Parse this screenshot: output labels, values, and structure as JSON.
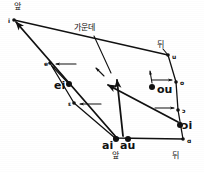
{
  "figure": {
    "type": "vowel-diagram",
    "width": 204,
    "height": 172,
    "ink_color": "#111111",
    "background_color": "#ffffff"
  },
  "axis_labels": [
    {
      "id": "front-top",
      "text": "앞",
      "x": 14,
      "y": 3,
      "meaning": "front"
    },
    {
      "id": "middle-top",
      "text": "가운데",
      "x": 74,
      "y": 24,
      "meaning": "middle"
    },
    {
      "id": "back-top",
      "text": "뒤",
      "x": 157,
      "y": 41,
      "meaning": "back"
    },
    {
      "id": "front-bottom",
      "text": "앞",
      "x": 112,
      "y": 152,
      "meaning": "front"
    },
    {
      "id": "back-bottom",
      "text": "뒤",
      "x": 172,
      "y": 152,
      "meaning": "back"
    }
  ],
  "vowel_points": [
    {
      "symbol": "i",
      "x": 14,
      "y": 20,
      "label_dx": -6,
      "label_dy": 1,
      "size": "small"
    },
    {
      "symbol": "e",
      "x": 50,
      "y": 63,
      "label_dx": -6,
      "label_dy": 1,
      "size": "small"
    },
    {
      "symbol": "ɛ",
      "x": 74,
      "y": 103,
      "label_dx": -6,
      "label_dy": 1,
      "size": "small"
    },
    {
      "symbol": "a",
      "x": 115,
      "y": 138,
      "label_dx": 0,
      "label_dy": 0,
      "size": "small"
    },
    {
      "symbol": "ɑ",
      "x": 183,
      "y": 139,
      "label_dx": 4,
      "label_dy": 2,
      "size": "small"
    },
    {
      "symbol": "ɔ",
      "x": 178,
      "y": 110,
      "label_dx": 4,
      "label_dy": 1,
      "size": "small"
    },
    {
      "symbol": "o",
      "x": 176,
      "y": 82,
      "label_dx": 4,
      "label_dy": 1,
      "size": "small"
    },
    {
      "symbol": "u",
      "x": 168,
      "y": 55,
      "label_dx": 4,
      "label_dy": 2,
      "size": "small"
    }
  ],
  "diphthongs": [
    {
      "symbol": "ei",
      "x": 69,
      "y": 84,
      "label_x": 54,
      "label_y": 80,
      "marker": "large"
    },
    {
      "symbol": "ai",
      "x": 116,
      "y": 139,
      "label_x": 102,
      "label_y": 140,
      "marker": "large"
    },
    {
      "symbol": "au",
      "x": 128,
      "y": 139,
      "label_x": 120,
      "label_y": 140,
      "marker": "large"
    },
    {
      "symbol": "ou",
      "x": 152,
      "y": 87,
      "label_x": 157,
      "label_y": 84,
      "marker": "large"
    },
    {
      "symbol": "ɔi",
      "x": 180,
      "y": 125,
      "label_x": 182,
      "label_y": 120,
      "marker": "large"
    }
  ],
  "quadrilateral": {
    "closed": false,
    "vertices": [
      {
        "x": 14,
        "y": 20
      },
      {
        "x": 168,
        "y": 55
      },
      {
        "x": 176,
        "y": 82
      },
      {
        "x": 178,
        "y": 110
      },
      {
        "x": 183,
        "y": 139
      },
      {
        "x": 115,
        "y": 138
      },
      {
        "x": 74,
        "y": 103
      },
      {
        "x": 50,
        "y": 63
      }
    ]
  },
  "glide_arrows": [
    {
      "id": "ei-to-e",
      "from": {
        "x": 69,
        "y": 84
      },
      "to": {
        "x": 52,
        "y": 66
      }
    },
    {
      "id": "ai-to-i",
      "from": {
        "x": 116,
        "y": 137
      },
      "to": {
        "x": 16,
        "y": 22
      }
    },
    {
      "id": "au-to-mid",
      "from": {
        "x": 123,
        "y": 136
      },
      "to": {
        "x": 117,
        "y": 80
      }
    },
    {
      "id": "ou-to-u",
      "from": {
        "x": 152,
        "y": 83
      },
      "to": {
        "x": 150,
        "y": 71
      }
    },
    {
      "id": "oi-to-mid",
      "from": {
        "x": 178,
        "y": 122
      },
      "to": {
        "x": 108,
        "y": 85
      }
    },
    {
      "id": "e-tick",
      "from": {
        "x": 76,
        "y": 64
      },
      "to": {
        "x": 56,
        "y": 64
      }
    },
    {
      "id": "eps-tick",
      "from": {
        "x": 101,
        "y": 104
      },
      "to": {
        "x": 80,
        "y": 104
      }
    },
    {
      "id": "o-tick",
      "from": {
        "x": 152,
        "y": 80
      },
      "to": {
        "x": 172,
        "y": 80
      }
    },
    {
      "id": "oc-tick",
      "from": {
        "x": 155,
        "y": 108
      },
      "to": {
        "x": 174,
        "y": 108
      }
    },
    {
      "id": "mid-tick",
      "from": {
        "x": 104,
        "y": 76
      },
      "to": {
        "x": 96,
        "y": 68
      }
    }
  ],
  "pointer_lines": [
    {
      "id": "ko-middle-pointer",
      "from": {
        "x": 94,
        "y": 36
      },
      "to": {
        "x": 111,
        "y": 73
      }
    },
    {
      "id": "ko-back-pointer",
      "from": {
        "x": 163,
        "y": 49
      },
      "to": {
        "x": 168,
        "y": 55
      }
    }
  ]
}
